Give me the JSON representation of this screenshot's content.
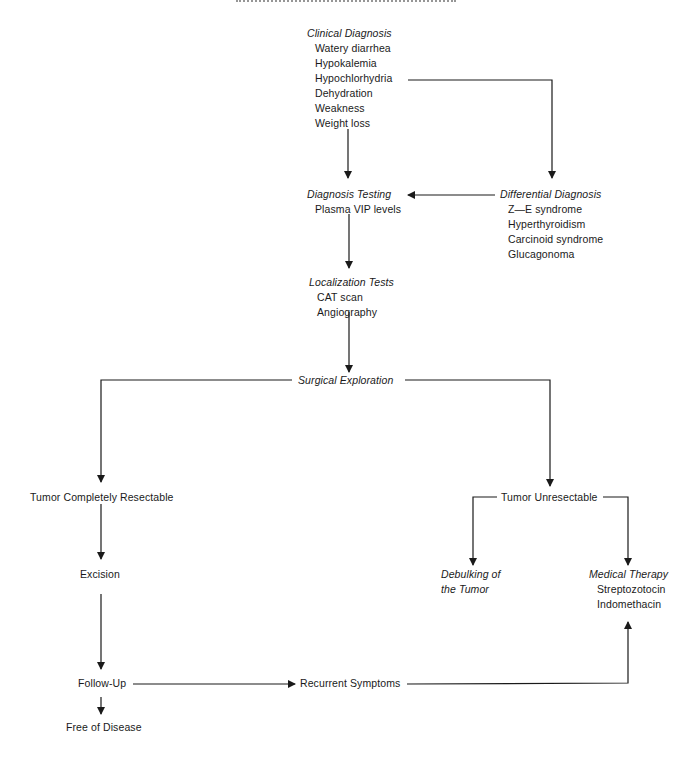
{
  "diagram": {
    "clinical_diagnosis": {
      "title": "Clinical Diagnosis",
      "items": [
        "Watery diarrhea",
        "Hypokalemia",
        "Hypochlorhydria",
        "Dehydration",
        "Weakness",
        "Weight loss"
      ]
    },
    "diagnosis_testing": {
      "title": "Diagnosis Testing",
      "items": [
        "Plasma VIP levels"
      ]
    },
    "differential_diagnosis": {
      "title": "Differential Diagnosis",
      "items": [
        "Z—E syndrome",
        "Hyperthyroidism",
        "Carcinoid syndrome",
        "Glucagonoma"
      ]
    },
    "localization_tests": {
      "title": "Localization Tests",
      "items": [
        "CAT scan",
        "Angiography"
      ]
    },
    "surgical_exploration": {
      "title": "Surgical Exploration"
    },
    "tumor_resectable": {
      "label": "Tumor Completely Resectable"
    },
    "tumor_unresectable": {
      "label": "Tumor Unresectable"
    },
    "excision": {
      "label": "Excision"
    },
    "debulking": {
      "line1": "Debulking of",
      "line2": "the Tumor"
    },
    "medical_therapy": {
      "title": "Medical Therapy",
      "items": [
        "Streptozotocin",
        "Indomethacin"
      ]
    },
    "follow_up": {
      "label": "Follow-Up"
    },
    "recurrent_symptoms": {
      "label": "Recurrent Symptoms"
    },
    "free_of_disease": {
      "label": "Free of Disease"
    }
  }
}
